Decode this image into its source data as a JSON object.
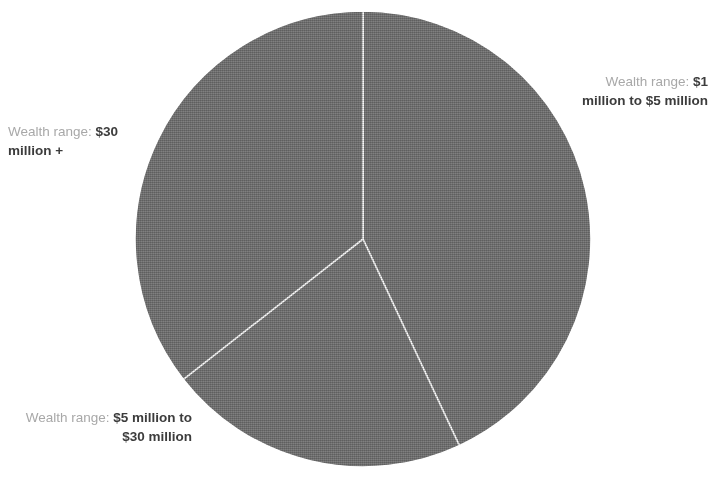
{
  "figure": {
    "background_color": "#ffffff",
    "slice_fill_color": "#808080",
    "slice_edge_color": "#ffffff",
    "label_lead_color": "#a8a8a8",
    "label_value_color": "#3c3c3c"
  },
  "labels": {
    "lead_text": "Wealth range:",
    "slice_a_value": "$1 million to $5 million",
    "slice_b_value": "$5 million to $30 million",
    "slice_c_value": "$30 million +"
  },
  "chart_data": {
    "type": "pie",
    "title": "",
    "subtitle": "",
    "xlabel": "",
    "ylabel": "",
    "legend_position": "none",
    "grid": false,
    "label_prefix": "Wealth range:",
    "categories": [
      "$1 million to $5 million",
      "$5 million to $30 million",
      "$30 million +"
    ],
    "values": [
      43,
      21,
      36
    ],
    "units": "percent",
    "start_angle_deg": 0,
    "direction": "clockwise",
    "slices": [
      {
        "label": "$1 million to $5 million",
        "value": 43,
        "start_angle_deg": 0,
        "end_angle_deg": 155,
        "color": "#808080",
        "label_position": "right"
      },
      {
        "label": "$5 million to $30 million",
        "value": 21,
        "start_angle_deg": 155,
        "end_angle_deg": 232,
        "color": "#808080",
        "label_position": "bottom-left"
      },
      {
        "label": "$30 million +",
        "value": 36,
        "start_angle_deg": 232,
        "end_angle_deg": 360,
        "color": "#808080",
        "label_position": "left"
      }
    ],
    "geometry": {
      "center_x": 363,
      "center_y": 239,
      "radius": 228
    }
  }
}
